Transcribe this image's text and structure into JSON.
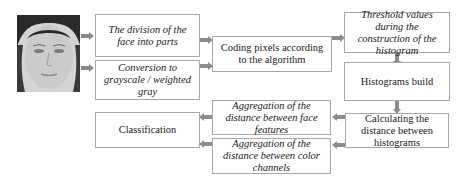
{
  "diagram": {
    "type": "flowchart",
    "photo": {
      "alt": "face photo (input image)"
    },
    "nodes": {
      "division": {
        "label": "The division of the face into parts"
      },
      "grayscale": {
        "label": "Conversion to grayscale / weighted gray"
      },
      "coding": {
        "label": "Coding pixels according to the algorithm"
      },
      "threshold": {
        "label": "Threshold values during the construction of the histogram"
      },
      "histograms": {
        "label": "Histograms build"
      },
      "distance": {
        "label": "Calculating the distance between histograms"
      },
      "agg_face": {
        "label": "Aggregation of the distance between face features"
      },
      "agg_color": {
        "label": "Aggregation of the distance between color channels"
      },
      "classification": {
        "label": "Classification"
      }
    },
    "edges": [
      [
        "photo",
        "division"
      ],
      [
        "photo",
        "grayscale"
      ],
      [
        "division",
        "coding"
      ],
      [
        "grayscale",
        "coding"
      ],
      [
        "coding",
        "threshold"
      ],
      [
        "threshold",
        "histograms"
      ],
      [
        "histograms",
        "distance"
      ],
      [
        "distance",
        "agg_face"
      ],
      [
        "distance",
        "agg_color"
      ],
      [
        "agg_face",
        "classification"
      ],
      [
        "agg_color",
        "classification"
      ]
    ],
    "colors": {
      "border": "#a8a8a8",
      "arrow": "#8c8c8c",
      "text": "#1a1a1a"
    }
  }
}
